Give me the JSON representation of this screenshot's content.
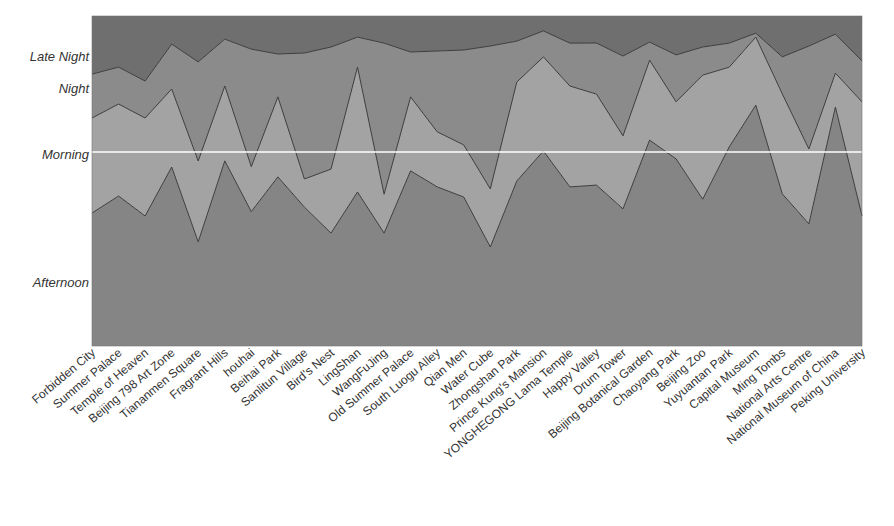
{
  "chart_data": {
    "type": "area",
    "stacked": true,
    "normalized_percent": true,
    "title": "",
    "xlabel": "",
    "ylabel": "",
    "ylim": [
      0,
      100
    ],
    "grid": false,
    "legend": "none (series named via y-axis labels)",
    "categories": [
      "Forbidden City",
      "Summer Palace",
      "Temple of Heaven",
      "Beijing 798 Art Zone",
      "Tiananmen Square",
      "Fragrant Hills",
      "houhai",
      "Beihai Park",
      "Sanlitun Village",
      "Bird's Nest",
      "LingShan",
      "WangFuJing",
      "Old Summer Palace",
      "South Luogu Alley",
      "Qian Men",
      "Water Cube",
      "Zhongshan Park",
      "Prince Kung's Mansion",
      "YONGHEGONG Lama Temple",
      "Happy Valley",
      "Drum Tower",
      "Beijing Botanical Garden",
      "Chaoyang Park",
      "Beijing Zoo",
      "Yuyuantan Park",
      "Capital Museum",
      "Ming Tombs",
      "National Arts Centre",
      "National Museum of China",
      "Peking University"
    ],
    "series": [
      {
        "name": "Afternoon",
        "color": "#858585",
        "values": [
          40.3,
          45.5,
          39.4,
          54.2,
          31.5,
          56.1,
          40.6,
          51.2,
          42.1,
          34.2,
          46.7,
          34.2,
          53.0,
          48.2,
          45.2,
          30.0,
          50.0,
          59.1,
          48.2,
          48.8,
          41.5,
          62.4,
          56.7,
          44.5,
          60.3,
          73.0,
          46.1,
          37.0,
          72.4,
          39.4
        ]
      },
      {
        "name": "Morning",
        "color": "#a3a3a3",
        "values": [
          28.8,
          27.9,
          29.7,
          23.6,
          24.5,
          22.7,
          13.6,
          24.2,
          8.5,
          19.4,
          37.9,
          11.8,
          22.4,
          16.7,
          15.8,
          17.6,
          30.0,
          28.5,
          30.6,
          27.6,
          22.1,
          24.2,
          17.3,
          37.6,
          24.2,
          20.6,
          30.3,
          22.7,
          10.3,
          34.5
        ]
      },
      {
        "name": "Night",
        "color": "#8b8b8b",
        "values": [
          13.3,
          11.2,
          11.2,
          13.6,
          30.0,
          14.2,
          35.5,
          13.0,
          38.2,
          37.0,
          9.1,
          45.8,
          13.6,
          24.5,
          28.8,
          43.3,
          12.4,
          7.9,
          13.0,
          15.5,
          24.2,
          5.5,
          14.2,
          8.5,
          7.3,
          1.2,
          11.2,
          31.2,
          11.8,
          12.4
        ]
      },
      {
        "name": "Late Night",
        "color": "#6f6f6f",
        "values": [
          17.6,
          15.5,
          19.7,
          8.5,
          13.9,
          7.0,
          10.0,
          11.5,
          11.2,
          9.4,
          6.4,
          8.2,
          10.9,
          10.6,
          10.3,
          9.1,
          7.6,
          4.5,
          8.2,
          8.2,
          12.1,
          7.9,
          11.8,
          9.4,
          8.2,
          5.2,
          12.4,
          9.1,
          5.5,
          13.6
        ]
      }
    ],
    "y_axis_labels": [
      {
        "text": "Late Night",
        "y_percent": 87.5
      },
      {
        "text": "Night",
        "y_percent": 77.9
      },
      {
        "text": "Morning",
        "y_percent": 58.0
      },
      {
        "text": "Afternoon",
        "y_percent": 19.1
      }
    ],
    "annotations": [
      {
        "type": "horizontal-line",
        "color": "#ffffff",
        "y_percent": 58.8
      }
    ],
    "line_color": "#3c3c3c"
  }
}
